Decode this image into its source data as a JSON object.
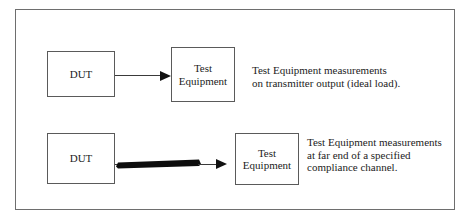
{
  "figure": {
    "border_color": "#6e6e6e",
    "background": "#ffffff"
  },
  "rows": [
    {
      "id": "ideal-load",
      "source_label": "DUT",
      "target_label": "Test\nEquipment",
      "connector_type": "thin-line-arrow",
      "caption": "Test Equipment measurements\non transmitter output (ideal load)."
    },
    {
      "id": "compliance-channel",
      "source_label": "DUT",
      "target_label": "Test\nEquipment",
      "connector_type": "thick-tapered-bar-arrow",
      "caption": "Test Equipment measurements\nat far end of a specified\ncompliance channel."
    }
  ],
  "colors": {
    "box_border": "#5a5a5a",
    "line": "#3a3a3a",
    "arrow_fill": "#111111",
    "channel_bar_fill": "#0d0d0d",
    "text": "#1c1c1c"
  }
}
